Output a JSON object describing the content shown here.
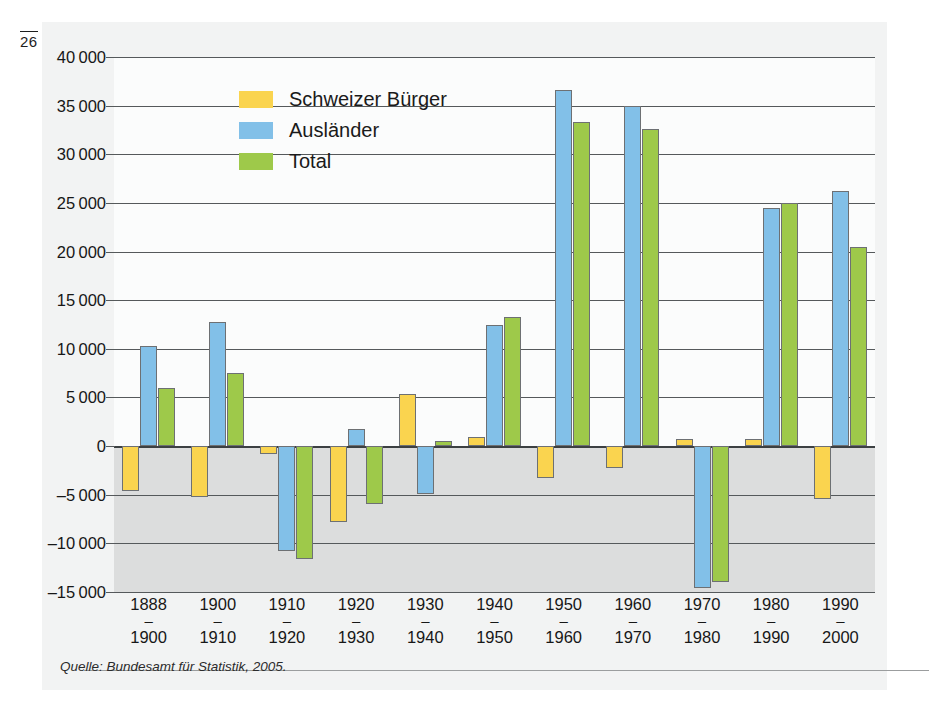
{
  "page_marker": "26",
  "source_note": "Quelle: Bundesamt für Statistik, 2005.",
  "legend": {
    "items": [
      {
        "label": "Schweizer Bürger",
        "color": "#fad44f"
      },
      {
        "label": "Ausländer",
        "color": "#82c0e8"
      },
      {
        "label": "Total",
        "color": "#9ec94a"
      }
    ]
  },
  "colors": {
    "schweizer": "#fad44f",
    "auslaender": "#82c0e8",
    "total": "#9ec94a",
    "bar_border": "#6d7073",
    "gridline": "#55595b",
    "negative_zone": "#dcdddd",
    "positive_zone": "#fbfcfc",
    "panel": "#f2f3f3"
  },
  "axes": {
    "y_ticks": [
      "40000",
      "35000",
      "30000",
      "25000",
      "20000",
      "15000",
      "10000",
      "5000",
      "0",
      "-5000",
      "-10000",
      "-15000"
    ],
    "y_tick_values": [
      40000,
      35000,
      30000,
      25000,
      20000,
      15000,
      10000,
      5000,
      0,
      -5000,
      -10000,
      -15000
    ],
    "x_labels": [
      {
        "from": "1888",
        "dash": "–",
        "to": "1900"
      },
      {
        "from": "1900",
        "dash": "–",
        "to": "1910"
      },
      {
        "from": "1910",
        "dash": "–",
        "to": "1920"
      },
      {
        "from": "1920",
        "dash": "–",
        "to": "1930"
      },
      {
        "from": "1930",
        "dash": "–",
        "to": "1940"
      },
      {
        "from": "1940",
        "dash": "–",
        "to": "1950"
      },
      {
        "from": "1950",
        "dash": "–",
        "to": "1960"
      },
      {
        "from": "1960",
        "dash": "–",
        "to": "1970"
      },
      {
        "from": "1970",
        "dash": "–",
        "to": "1980"
      },
      {
        "from": "1980",
        "dash": "–",
        "to": "1990"
      },
      {
        "from": "1990",
        "dash": "–",
        "to": "2000"
      }
    ]
  },
  "chart_data": {
    "type": "bar",
    "title": "",
    "xlabel": "",
    "ylabel": "",
    "ylim": [
      -15000,
      40000
    ],
    "grid": true,
    "legend_position": "top-left-inside",
    "categories": [
      "1888–1900",
      "1900–1910",
      "1910–1920",
      "1920–1930",
      "1930–1940",
      "1940–1950",
      "1950–1960",
      "1960–1970",
      "1970–1980",
      "1980–1990",
      "1990–2000"
    ],
    "series": [
      {
        "name": "Schweizer Bürger",
        "color": "#fad44f",
        "values": [
          -4600,
          -5200,
          -800,
          -7800,
          5400,
          900,
          -3300,
          -2300,
          700,
          700,
          -5400
        ]
      },
      {
        "name": "Ausländer",
        "color": "#82c0e8",
        "values": [
          10300,
          12800,
          -10800,
          1800,
          -4900,
          12400,
          36600,
          35000,
          -14600,
          24500,
          26200
        ]
      },
      {
        "name": "Total",
        "color": "#9ec94a",
        "values": [
          6000,
          7500,
          -11600,
          -6000,
          500,
          13300,
          33300,
          32600,
          -14000,
          25000,
          20500
        ]
      }
    ]
  }
}
